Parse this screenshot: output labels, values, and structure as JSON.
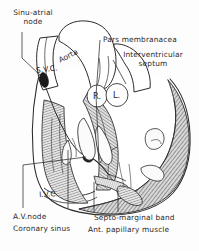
{
  "figure": {
    "type": "anatomical-line-drawing",
    "background_color": "#fdfdfd",
    "ink_color": "#2b2b2b"
  },
  "labels": {
    "sinu_atrial_node": "Sinu-atrial\nnode",
    "pars_membranacea": "Pars membranacea",
    "interventricular_septum": "Interventricular\nseptum",
    "av_node": "A.V.node",
    "coronary_sinus": "Coronary sinus",
    "septo_marginal_band": "Septo-marginal band",
    "ant_papillary_muscle": "Ant. papillary muscle"
  },
  "structures": {
    "aorta": "Aorta",
    "svc": "S.V.C.",
    "ivc": "I.V.C.",
    "right_chamber": "R.",
    "left_chamber": "L."
  }
}
